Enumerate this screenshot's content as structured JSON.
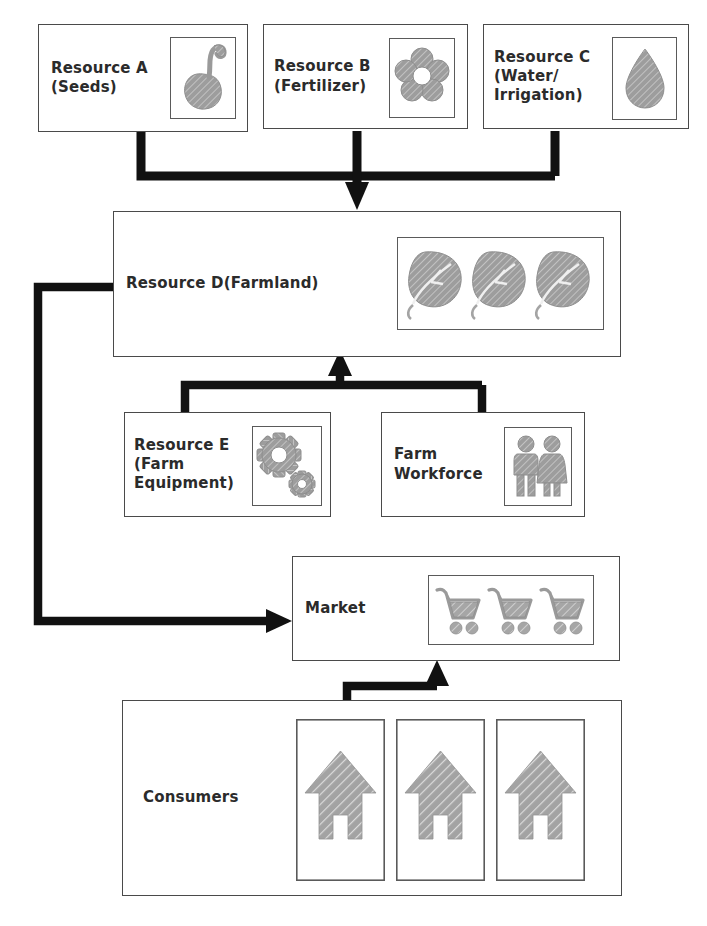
{
  "diagram": {
    "background_color": "#ffffff",
    "box_border_color": "#4a4a4a",
    "connector_color": "#111111",
    "icon_fill_color": "#9a9a9a"
  },
  "nodes": [
    {
      "id": "resource-a",
      "label": "Resource A\n(Seeds)",
      "icon": "seed-sprout-icon",
      "x": 38,
      "y": 24,
      "w": 210,
      "h": 108,
      "text_x": 12,
      "font_size": 15,
      "icon_x": 131,
      "icon_y": 12,
      "icon_w": 66,
      "icon_h": 82
    },
    {
      "id": "resource-b",
      "label": "Resource B\n(Fertilizer)",
      "icon": "flower-icon",
      "x": 263,
      "y": 24,
      "w": 205,
      "h": 105,
      "text_x": 10,
      "font_size": 15,
      "icon_x": 125,
      "icon_y": 13,
      "icon_w": 66,
      "icon_h": 80
    },
    {
      "id": "resource-c",
      "label": "Resource C\n(Water/\nIrrigation)",
      "icon": "water-drop-icon",
      "x": 483,
      "y": 24,
      "w": 206,
      "h": 105,
      "text_x": 10,
      "font_size": 15,
      "icon_x": 128,
      "icon_y": 12,
      "icon_w": 65,
      "icon_h": 83
    },
    {
      "id": "resource-d",
      "label": "Resource D(Farmland)",
      "icon": "three-leaves-icon",
      "x": 113,
      "y": 211,
      "w": 508,
      "h": 146,
      "text_x": 12,
      "font_size": 15,
      "icon_x": 283,
      "icon_y": 25,
      "icon_w": 207,
      "icon_h": 93
    },
    {
      "id": "resource-e",
      "label": "Resource E\n(Farm\nEquipment)",
      "icon": "gears-icon",
      "x": 124,
      "y": 412,
      "w": 207,
      "h": 105,
      "text_x": 9,
      "font_size": 15,
      "icon_x": 127,
      "icon_y": 13,
      "icon_w": 70,
      "icon_h": 80
    },
    {
      "id": "farm-workforce",
      "label": "Farm\nWorkforce",
      "icon": "two-people-icon",
      "x": 381,
      "y": 412,
      "w": 204,
      "h": 105,
      "text_x": 12,
      "font_size": 15,
      "icon_x": 122,
      "icon_y": 14,
      "icon_w": 68,
      "icon_h": 79
    },
    {
      "id": "market",
      "label": "Market",
      "icon": "shopping-carts-icon",
      "x": 292,
      "y": 556,
      "w": 328,
      "h": 105,
      "text_x": 12,
      "font_size": 15,
      "icon_x": 135,
      "icon_y": 18,
      "icon_w": 166,
      "icon_h": 70
    },
    {
      "id": "consumers",
      "label": "Consumers",
      "icon": "three-houses-icon",
      "x": 122,
      "y": 700,
      "w": 500,
      "h": 196,
      "text_x": 20,
      "font_size": 15,
      "icon_x": 173,
      "icon_y": 18,
      "icon_w": 289,
      "icon_h": 162
    }
  ],
  "connectors": [
    {
      "id": "a-b-c-to-d",
      "label": "Resources A, B and C feed into Resource D (Farmland)"
    },
    {
      "id": "e-and-workforce-to-d",
      "label": "Resource E and Farm Workforce feed into Resource D (Farmland)"
    },
    {
      "id": "d-to-market",
      "label": "Resource D (Farmland) supplies the Market"
    },
    {
      "id": "consumers-to-market",
      "label": "Consumers connect to the Market"
    }
  ]
}
